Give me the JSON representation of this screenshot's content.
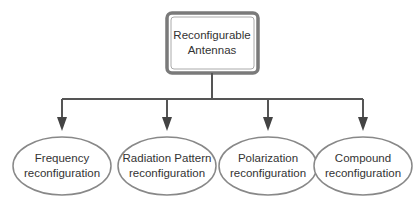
{
  "diagram": {
    "root": {
      "label_line1": "Reconfigurable",
      "label_line2": "Antennas"
    },
    "children": [
      {
        "line1": "Frequency",
        "line2": "reconfiguration"
      },
      {
        "line1": "Radiation Pattern",
        "line2": "reconfiguration"
      },
      {
        "line1": "Polarization",
        "line2": "reconfiguration"
      },
      {
        "line1": "Compound",
        "line2": "reconfiguration"
      }
    ],
    "colors": {
      "stroke": "#555555",
      "box_border": "#777777",
      "text": "#333333"
    }
  }
}
